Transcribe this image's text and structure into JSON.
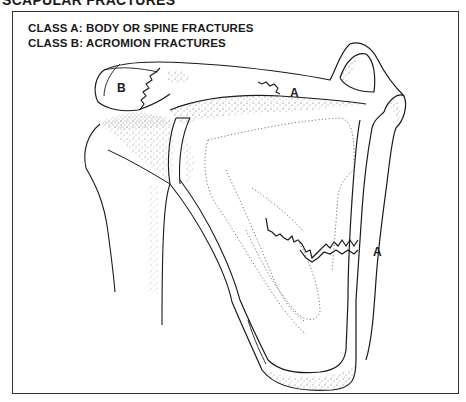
{
  "figure": {
    "title": "SCAPULAR FRACTURES",
    "legend": [
      {
        "id": "A",
        "text": "CLASS A: BODY OR SPINE FRACTURES"
      },
      {
        "id": "B",
        "text": "CLASS B: ACROMION FRACTURES"
      }
    ],
    "labels": [
      {
        "name": "acromion-fracture-label",
        "text": "B"
      },
      {
        "name": "spine-fracture-label",
        "text": "A"
      },
      {
        "name": "body-fracture-label",
        "text": "A"
      }
    ],
    "colors": {
      "line": "#1a1a1a",
      "stipple": "#555555",
      "frame": "#333333",
      "background": "#ffffff"
    }
  }
}
